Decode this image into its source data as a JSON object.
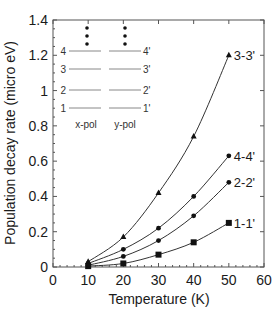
{
  "chart_data": {
    "type": "line",
    "title": "",
    "xlabel": "Temperature (K)",
    "ylabel": "Population decay rate (micro eV)",
    "xlim": [
      0,
      60
    ],
    "ylim": [
      0,
      1.4
    ],
    "xticks": [
      0,
      10,
      20,
      30,
      40,
      50,
      60
    ],
    "yticks": [
      0,
      0.2,
      0.4,
      0.6,
      0.8,
      1,
      1.2,
      1.4
    ],
    "ytick_labels": [
      "0",
      "0.2",
      "0.4",
      "0.6",
      "0.8",
      "1",
      "1.2",
      "1.4"
    ],
    "grid": false,
    "x": [
      10,
      20,
      30,
      40,
      50
    ],
    "series": [
      {
        "name": "3-3'",
        "marker": "triangle",
        "values": [
          0.03,
          0.17,
          0.42,
          0.74,
          1.2
        ]
      },
      {
        "name": "4-4'",
        "marker": "circle",
        "values": [
          0.02,
          0.1,
          0.22,
          0.4,
          0.63
        ]
      },
      {
        "name": "2-2'",
        "marker": "circle",
        "values": [
          0.01,
          0.06,
          0.15,
          0.29,
          0.48
        ]
      },
      {
        "name": "1-1'",
        "marker": "square",
        "values": [
          0.005,
          0.02,
          0.07,
          0.14,
          0.25
        ]
      }
    ],
    "inset_legend": {
      "description": "Energy level diagram",
      "left_levels": [
        "4",
        "3",
        "2",
        "1"
      ],
      "right_levels": [
        "4'",
        "3'",
        "2'",
        "1'"
      ],
      "left_caption": "x-pol",
      "right_caption": "y-pol",
      "ellipsis": "⋮"
    }
  },
  "colors": {
    "line": "#333333",
    "marker": "#111111",
    "axis": "#555555",
    "text": "#1a1a1a"
  }
}
